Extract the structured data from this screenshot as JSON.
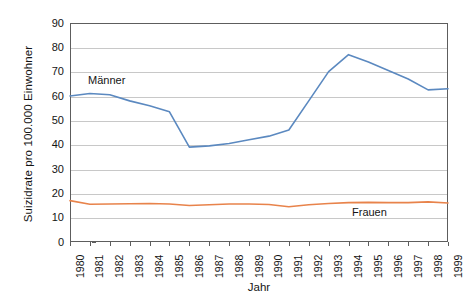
{
  "chart_data": {
    "type": "line",
    "title": "",
    "xlabel": "Jahr",
    "ylabel": "Suizidrate pro 100.000 Einwohner",
    "categories": [
      "1980",
      "1981",
      "1982",
      "1983",
      "1984",
      "1985",
      "1986",
      "1987",
      "1988",
      "1989",
      "1990",
      "1991",
      "1992",
      "1993",
      "1994",
      "1995",
      "1996",
      "1997",
      "1998",
      "1999"
    ],
    "ylim": [
      0,
      90
    ],
    "ytick_values": [
      0,
      10,
      20,
      30,
      40,
      50,
      60,
      70,
      80,
      90
    ],
    "grid": true,
    "legend_position": "inline-annotation",
    "series": [
      {
        "name": "Männer",
        "color": "#5b89c0",
        "values": [
          60,
          61,
          60.5,
          58,
          56,
          53.5,
          39,
          39.5,
          40.5,
          42,
          43.5,
          46,
          58,
          70,
          77,
          74,
          70.5,
          67,
          62.5,
          63
        ]
      },
      {
        "name": "Frauen",
        "color": "#e8834b",
        "values": [
          17,
          15.5,
          15.6,
          15.7,
          15.8,
          15.6,
          15,
          15.3,
          15.6,
          15.6,
          15.4,
          14.5,
          15.3,
          15.8,
          16.2,
          16.3,
          16.2,
          16.2,
          16.5,
          16
        ]
      }
    ],
    "annotations": [
      {
        "text": "Männer",
        "x_year": "1981",
        "y_value": 66
      },
      {
        "text": "Frauen",
        "x_year": "1995",
        "y_value": 13
      }
    ]
  },
  "axes": {
    "y_axis_title": "Suizidrate pro 100.000 Einwohner",
    "x_axis_title": "Jahr",
    "y_ticks": [
      "0",
      "10",
      "20",
      "30",
      "40",
      "50",
      "60",
      "70",
      "80",
      "90"
    ],
    "x_ticks": [
      "1980",
      "1981",
      "1982",
      "1983",
      "1984",
      "1985",
      "1986",
      "1987",
      "1988",
      "1989",
      "1990",
      "1991",
      "1992",
      "1993",
      "1994",
      "1995",
      "1996",
      "1997",
      "1998",
      "1999"
    ]
  },
  "labels": {
    "maenner": "Männer",
    "frauen": "Frauen"
  },
  "colors": {
    "men_line": "#5b89c0",
    "women_line": "#e8834b",
    "grid": "#c8c8c8",
    "frame": "#5d5d5d",
    "background": "#ffffff",
    "text": "#141414"
  }
}
